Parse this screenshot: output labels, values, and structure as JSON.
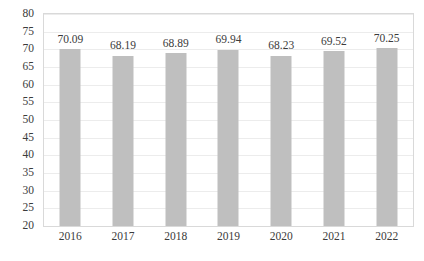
{
  "chart_data": {
    "type": "bar",
    "title": "",
    "subtitle": "",
    "xlabel": "",
    "ylabel": "",
    "categories": [
      "2016",
      "2017",
      "2018",
      "2019",
      "2020",
      "2021",
      "2022"
    ],
    "values": [
      70.09,
      68.19,
      68.89,
      69.94,
      68.23,
      69.52,
      70.25
    ],
    "data_labels": [
      "70.09",
      "68.19",
      "68.89",
      "69.94",
      "68.23",
      "69.52",
      "70.25"
    ],
    "ylim": [
      20,
      80
    ],
    "ytick_step": 5,
    "ytick_labels": [
      "80",
      "75",
      "70",
      "65",
      "60",
      "55",
      "50",
      "45",
      "40",
      "35",
      "30",
      "25",
      "20"
    ],
    "ytick_values": [
      80,
      75,
      70,
      65,
      60,
      55,
      50,
      45,
      40,
      35,
      30,
      25,
      20
    ],
    "grid": true,
    "legend": false,
    "legend_position": "none",
    "series": [
      {
        "name": "",
        "values": [
          70.09,
          68.19,
          68.89,
          69.94,
          68.23,
          69.52,
          70.25
        ]
      }
    ],
    "colors": {
      "bar": "#BFBFBF",
      "gridline": "#ECECEC",
      "plot_border": "#D9D9D9",
      "text": "#3B3B3B",
      "background": "#FFFFFF"
    }
  }
}
